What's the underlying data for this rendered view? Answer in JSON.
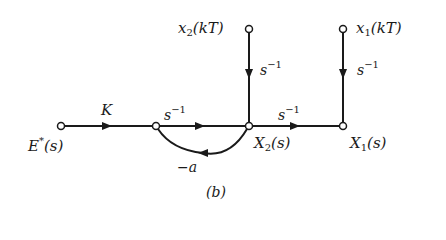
{
  "diagram": {
    "type": "signal-flow-graph",
    "caption": "(b)",
    "nodes": [
      {
        "id": "E",
        "label_main": "E",
        "label_sup": "*",
        "label_arg": "(s)"
      },
      {
        "id": "N1",
        "label_main": ""
      },
      {
        "id": "X2",
        "label_main": "X",
        "label_sub": "2",
        "label_arg": "(s)"
      },
      {
        "id": "X1",
        "label_main": "X",
        "label_sub": "1",
        "label_arg": "(s)"
      },
      {
        "id": "x2kT",
        "label_main": "x",
        "label_sub": "2",
        "label_arg": "(kT)"
      },
      {
        "id": "x1kT",
        "label_main": "x",
        "label_sub": "1",
        "label_arg": "(kT)"
      }
    ],
    "branches": [
      {
        "from": "E",
        "to": "N1",
        "gain": "K"
      },
      {
        "from": "N1",
        "to": "X2",
        "gain_base": "s",
        "gain_exp": "−1"
      },
      {
        "from": "X2",
        "to": "X1",
        "gain_base": "s",
        "gain_exp": "−1"
      },
      {
        "from": "x2kT",
        "to": "X2",
        "gain_base": "s",
        "gain_exp": "−1"
      },
      {
        "from": "x1kT",
        "to": "X1",
        "gain_base": "s",
        "gain_exp": "−1"
      },
      {
        "from": "X2",
        "to": "N1",
        "gain": "−a"
      }
    ]
  }
}
